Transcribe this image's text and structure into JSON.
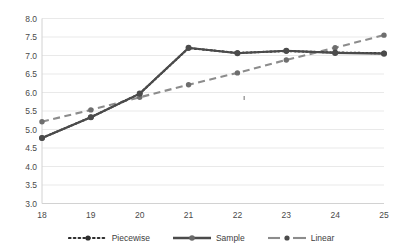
{
  "chart_data": {
    "type": "line",
    "title": "",
    "xlabel": "",
    "ylabel": "",
    "x": [
      18,
      19,
      20,
      21,
      22,
      23,
      24,
      25
    ],
    "categories": [
      "18",
      "19",
      "20",
      "21",
      "22",
      "23",
      "24",
      "25"
    ],
    "xlim": [
      18,
      25
    ],
    "ylim": [
      3.0,
      8.0
    ],
    "ytick_labels": [
      "8.0",
      "7.5",
      "7.0",
      "6.5",
      "6.0",
      "5.5",
      "5.0",
      "4.5",
      "4.0",
      "3.5",
      "3.0"
    ],
    "ytick_values": [
      8.0,
      7.5,
      7.0,
      6.5,
      6.0,
      5.5,
      5.0,
      4.5,
      4.0,
      3.5,
      3.0
    ],
    "grid": true,
    "legend_position": "bottom",
    "series": [
      {
        "name": "Piecewise",
        "style": "dotted",
        "color": "#2e2e2e",
        "values": [
          4.77,
          5.33,
          5.97,
          7.2,
          7.07,
          7.12,
          7.08,
          7.06
        ]
      },
      {
        "name": "Sample",
        "style": "solid",
        "color": "#4b4b4b",
        "values": [
          4.77,
          5.33,
          5.97,
          7.21,
          7.06,
          7.13,
          7.07,
          7.05
        ]
      },
      {
        "name": "Linear",
        "style": "dashed",
        "color": "#8c8c8c",
        "values": [
          5.21,
          5.53,
          5.87,
          6.21,
          6.53,
          6.88,
          7.21,
          7.55
        ]
      }
    ]
  },
  "legend": {
    "items": [
      {
        "label": "Piecewise",
        "style": "dotted"
      },
      {
        "label": "Sample",
        "style": "solid"
      },
      {
        "label": "Linear",
        "style": "dashed"
      }
    ]
  }
}
